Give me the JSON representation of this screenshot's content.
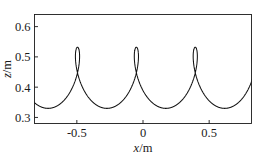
{
  "chart_data": {
    "type": "line",
    "title": "",
    "xlabel": "x/m",
    "ylabel": "z/m",
    "xlim": [
      -0.82,
      0.82
    ],
    "ylim": [
      0.28,
      0.64
    ],
    "xticks": [
      -0.5,
      0,
      0.5
    ],
    "xticklabels": [
      "-0.5",
      "0",
      "0.5"
    ],
    "yticks": [
      0.3,
      0.4,
      0.5,
      0.6
    ],
    "yticklabels": [
      "0.3",
      "0.4",
      "0.5",
      "0.6"
    ],
    "grid": false,
    "legend": null,
    "series": [
      {
        "name": "trochoid trajectory",
        "description": "prolate cycloid (looping trochoid) path of a point",
        "color": "#111111",
        "curve_params": {
          "form": "prolate_cycloid",
          "period_m": 0.445,
          "z_center": 0.43,
          "z_max": 0.532,
          "z_min": 0.33,
          "loop_centers_x": [
            -0.72,
            -0.49,
            -0.05,
            0.39,
            0.74
          ],
          "trough_centers_x": [
            -0.64,
            -0.27,
            0.17,
            0.61
          ],
          "crossing_z": 0.445,
          "a": 0.0708,
          "b": 0.101,
          "phase": 0.0
        }
      }
    ]
  },
  "axes": {
    "x_axis_name": "x-axis",
    "y_axis_name": "z-axis",
    "box_on": true
  }
}
